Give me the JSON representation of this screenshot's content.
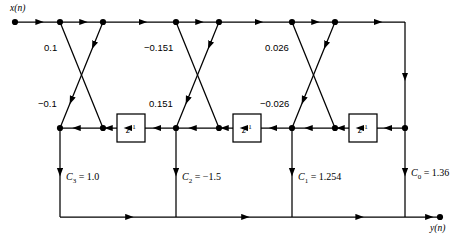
{
  "diagram": {
    "io": {
      "input_label": "x(n)",
      "output_label": "y(n)"
    },
    "delay_label_base": "z",
    "delay_label_exp": "-1",
    "delay_blocks": [
      {
        "name": "delay-1",
        "x": 117,
        "y": 114,
        "w": 28,
        "h": 28
      },
      {
        "name": "delay-2",
        "x": 233,
        "y": 114,
        "w": 28,
        "h": 28
      },
      {
        "name": "delay-3",
        "x": 349,
        "y": 114,
        "w": 28,
        "h": 28
      }
    ],
    "stages": [
      {
        "index": 1,
        "k_up_label": "0.1",
        "k_down_label": "−0.1",
        "top_left_x": 60,
        "top_right_x": 103,
        "bot_left_x": 60,
        "bot_right_x": 103
      },
      {
        "index": 2,
        "k_up_label": "−0.151",
        "k_down_label": "0.151",
        "top_left_x": 176,
        "top_right_x": 219,
        "bot_left_x": 176,
        "bot_right_x": 219
      },
      {
        "index": 3,
        "k_up_label": "0.026",
        "k_down_label": "−0.026",
        "top_left_x": 292,
        "top_right_x": 335,
        "bot_left_x": 292,
        "bot_right_x": 335
      }
    ],
    "ladder_taps": [
      {
        "name": "tap-c3",
        "sym": "C",
        "sub": "3",
        "eq": " = 1.0",
        "x": 60,
        "label_x": 66,
        "label_y": 172
      },
      {
        "name": "tap-c2",
        "sym": "C",
        "sub": "2",
        "eq": " = −1.5",
        "x": 176,
        "label_x": 182,
        "label_y": 172
      },
      {
        "name": "tap-c1",
        "sym": "C",
        "sub": "1",
        "eq": " = 1.254",
        "x": 292,
        "label_x": 298,
        "label_y": 172
      },
      {
        "name": "tap-c0",
        "sym": "C",
        "sub": "0",
        "eq": " = 1.36",
        "x": 405,
        "label_x": 411,
        "label_y": 168
      }
    ],
    "rails": {
      "top_y": 22,
      "mid_y": 128,
      "bottom_y": 217,
      "input_dot_x": 15,
      "output_dot_x": 440,
      "right_edge_x": 405
    },
    "coefficient_label_positions": {
      "up_y": 43,
      "down_y": 99
    },
    "colors": {
      "line": "#000000",
      "background": "#ffffff",
      "text": "#000000"
    }
  }
}
